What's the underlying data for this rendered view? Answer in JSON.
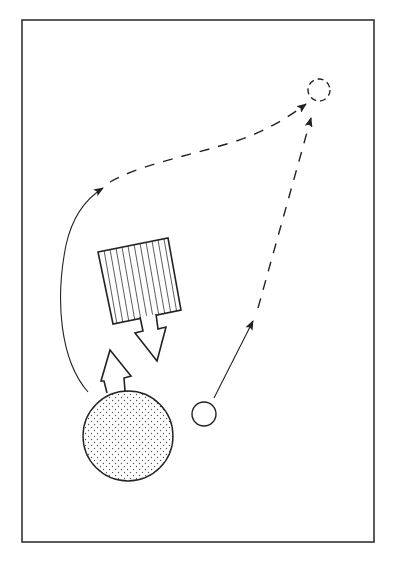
{
  "figure": {
    "width": 395,
    "height": 562,
    "background": "#ffffff",
    "ink": "#222222",
    "frame": {
      "x": 22,
      "y": 20,
      "width": 352,
      "height": 522
    }
  },
  "elements": {
    "large_body": {
      "kind": "stippled-circle",
      "cx": 128,
      "cy": 436,
      "r": 45
    },
    "small_body": {
      "kind": "open-circle",
      "cx": 204,
      "cy": 414,
      "r": 12
    },
    "target_position": {
      "kind": "dashed-circle",
      "cx": 319,
      "cy": 90,
      "r": 11
    },
    "obstacle": {
      "kind": "hatched-square",
      "corners": [
        [
          98,
          252
        ],
        [
          168,
          238
        ],
        [
          181,
          310
        ],
        [
          113,
          324
        ]
      ]
    },
    "push_arrow_up": {
      "kind": "block-arrow",
      "direction": "up",
      "attached_to": "large_body"
    },
    "push_arrow_down": {
      "kind": "block-arrow",
      "direction": "down",
      "attached_to": "obstacle"
    },
    "curved_path": {
      "kind": "solid-then-dashed",
      "from": "large_body",
      "to": "target_position"
    },
    "straight_path": {
      "kind": "solid-then-dashed",
      "from": "small_body",
      "to": "target_position"
    }
  }
}
